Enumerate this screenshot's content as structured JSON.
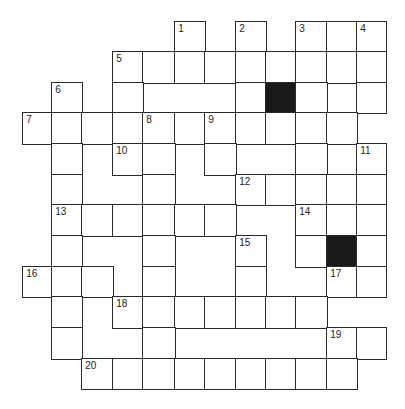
{
  "puzzle": {
    "type": "crossword",
    "colors": {
      "line": "#2a2a2a",
      "block": "#1a1a1a",
      "background": "#ffffff",
      "number": "#222222"
    },
    "col_edges": [
      23,
      52,
      82,
      113,
      143,
      175,
      205,
      236,
      266,
      296,
      327,
      357,
      386
    ],
    "row_edges": [
      22,
      52,
      83,
      113,
      144,
      175,
      205,
      236,
      267,
      297,
      328,
      359,
      389
    ],
    "cells": [
      {
        "r": 0,
        "c": 5,
        "n": "1"
      },
      {
        "r": 0,
        "c": 7,
        "n": "2"
      },
      {
        "r": 0,
        "c": 9,
        "n": "3"
      },
      {
        "r": 0,
        "c": 10
      },
      {
        "r": 0,
        "c": 11,
        "n": "4"
      },
      {
        "r": 1,
        "c": 3,
        "n": "5"
      },
      {
        "r": 1,
        "c": 4
      },
      {
        "r": 1,
        "c": 5
      },
      {
        "r": 1,
        "c": 6
      },
      {
        "r": 1,
        "c": 7
      },
      {
        "r": 1,
        "c": 8
      },
      {
        "r": 1,
        "c": 9
      },
      {
        "r": 1,
        "c": 10
      },
      {
        "r": 1,
        "c": 11
      },
      {
        "r": 2,
        "c": 1,
        "n": "6"
      },
      {
        "r": 2,
        "c": 3
      },
      {
        "r": 2,
        "c": 7
      },
      {
        "r": 2,
        "c": 8,
        "block": true
      },
      {
        "r": 2,
        "c": 9
      },
      {
        "r": 2,
        "c": 11
      },
      {
        "r": 3,
        "c": 0,
        "n": "7"
      },
      {
        "r": 3,
        "c": 1
      },
      {
        "r": 3,
        "c": 2
      },
      {
        "r": 3,
        "c": 3
      },
      {
        "r": 3,
        "c": 4,
        "n": "8"
      },
      {
        "r": 3,
        "c": 5
      },
      {
        "r": 3,
        "c": 6,
        "n": "9"
      },
      {
        "r": 3,
        "c": 7
      },
      {
        "r": 3,
        "c": 8
      },
      {
        "r": 3,
        "c": 9
      },
      {
        "r": 3,
        "c": 10
      },
      {
        "r": 4,
        "c": 1
      },
      {
        "r": 4,
        "c": 3,
        "n": "10"
      },
      {
        "r": 4,
        "c": 4
      },
      {
        "r": 4,
        "c": 6
      },
      {
        "r": 4,
        "c": 9
      },
      {
        "r": 4,
        "c": 11,
        "n": "11"
      },
      {
        "r": 5,
        "c": 1
      },
      {
        "r": 5,
        "c": 4
      },
      {
        "r": 5,
        "c": 7,
        "n": "12"
      },
      {
        "r": 5,
        "c": 8
      },
      {
        "r": 5,
        "c": 9
      },
      {
        "r": 5,
        "c": 10
      },
      {
        "r": 5,
        "c": 11
      },
      {
        "r": 6,
        "c": 1,
        "n": "13"
      },
      {
        "r": 6,
        "c": 2
      },
      {
        "r": 6,
        "c": 3
      },
      {
        "r": 6,
        "c": 4
      },
      {
        "r": 6,
        "c": 5
      },
      {
        "r": 6,
        "c": 6
      },
      {
        "r": 6,
        "c": 9,
        "n": "14"
      },
      {
        "r": 6,
        "c": 10
      },
      {
        "r": 6,
        "c": 11
      },
      {
        "r": 7,
        "c": 1
      },
      {
        "r": 7,
        "c": 4
      },
      {
        "r": 7,
        "c": 7,
        "n": "15"
      },
      {
        "r": 7,
        "c": 9
      },
      {
        "r": 7,
        "c": 10,
        "block": true
      },
      {
        "r": 7,
        "c": 11
      },
      {
        "r": 8,
        "c": 0,
        "n": "16"
      },
      {
        "r": 8,
        "c": 1
      },
      {
        "r": 8,
        "c": 2
      },
      {
        "r": 8,
        "c": 4
      },
      {
        "r": 8,
        "c": 7
      },
      {
        "r": 8,
        "c": 10,
        "n": "17"
      },
      {
        "r": 8,
        "c": 11
      },
      {
        "r": 9,
        "c": 1
      },
      {
        "r": 9,
        "c": 3,
        "n": "18"
      },
      {
        "r": 9,
        "c": 4
      },
      {
        "r": 9,
        "c": 5
      },
      {
        "r": 9,
        "c": 6
      },
      {
        "r": 9,
        "c": 7
      },
      {
        "r": 9,
        "c": 8
      },
      {
        "r": 9,
        "c": 9
      },
      {
        "r": 10,
        "c": 1
      },
      {
        "r": 10,
        "c": 4
      },
      {
        "r": 10,
        "c": 10,
        "n": "19"
      },
      {
        "r": 10,
        "c": 11
      },
      {
        "r": 11,
        "c": 2,
        "n": "20"
      },
      {
        "r": 11,
        "c": 3
      },
      {
        "r": 11,
        "c": 4
      },
      {
        "r": 11,
        "c": 5
      },
      {
        "r": 11,
        "c": 6
      },
      {
        "r": 11,
        "c": 7
      },
      {
        "r": 11,
        "c": 8
      },
      {
        "r": 11,
        "c": 9
      },
      {
        "r": 11,
        "c": 10
      }
    ],
    "clue_numbers": [
      "1",
      "2",
      "3",
      "4",
      "5",
      "6",
      "7",
      "8",
      "9",
      "10",
      "11",
      "12",
      "13",
      "14",
      "15",
      "16",
      "17",
      "18",
      "19",
      "20"
    ]
  }
}
